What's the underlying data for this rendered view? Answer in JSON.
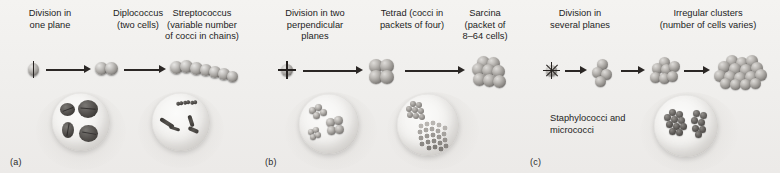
{
  "figure": {
    "background_color": "#f2f1ef",
    "cell_color": "#8e8b87",
    "micrograph_cell_color": "#413e3b"
  },
  "panels": [
    {
      "letter": "(a)",
      "id": "one-plane",
      "captions": [
        {
          "id": "division-one-plane",
          "lines": [
            "Division in",
            "one plane"
          ]
        },
        {
          "id": "diplococcus",
          "lines": [
            "Diplococcus",
            "(two cells)"
          ]
        },
        {
          "id": "streptococcus",
          "lines": [
            "Streptococcus",
            "(variable number",
            "of cocci in chains)"
          ]
        }
      ],
      "stages": [
        {
          "id": "single-dividing-cell",
          "cells": 1,
          "division_planes": 1
        },
        {
          "id": "diplococcus-pair",
          "cells": 2
        },
        {
          "id": "streptococcus-chain",
          "cells": 7
        }
      ],
      "arrows": 2,
      "insets": [
        {
          "id": "diplococci-micrograph",
          "label": ""
        },
        {
          "id": "streptococci-micrograph",
          "label": ""
        }
      ]
    },
    {
      "letter": "(b)",
      "id": "two-perpendicular-planes",
      "captions": [
        {
          "id": "division-two-planes",
          "lines": [
            "Division in two",
            "perpendicular",
            "planes"
          ]
        },
        {
          "id": "tetrad",
          "lines": [
            "Tetrad (cocci in",
            "packets of four)"
          ]
        },
        {
          "id": "sarcina",
          "lines": [
            "Sarcina",
            "(packet of",
            "8–64 cells)"
          ]
        }
      ],
      "stages": [
        {
          "id": "single-dividing-cell",
          "cells": 1,
          "division_planes": 2
        },
        {
          "id": "tetrad-packet",
          "cells": 4
        },
        {
          "id": "sarcina-packet",
          "cells": 8
        }
      ],
      "arrows": 2,
      "insets": [
        {
          "id": "tetrad-micrograph",
          "label": ""
        },
        {
          "id": "sarcina-micrograph",
          "label": ""
        }
      ]
    },
    {
      "letter": "(c)",
      "id": "several-planes",
      "captions": [
        {
          "id": "division-several-planes",
          "lines": [
            "Division in",
            "several planes"
          ]
        },
        {
          "id": "irregular-clusters",
          "lines": [
            "Irregular clusters",
            "(number of cells varies)"
          ]
        }
      ],
      "stages": [
        {
          "id": "single-dividing-cell",
          "cells": 1,
          "division_planes": 3
        },
        {
          "id": "small-cluster",
          "cells": 4
        },
        {
          "id": "medium-cluster",
          "cells": 7
        },
        {
          "id": "large-irregular-cluster",
          "cells": 16
        }
      ],
      "arrows": 3,
      "insets": [
        {
          "id": "staphylococci-micrograph",
          "label": "Staphylococci and micrococci"
        }
      ],
      "inset_label_lines": [
        "Staphylococci and",
        "micrococci"
      ]
    }
  ]
}
